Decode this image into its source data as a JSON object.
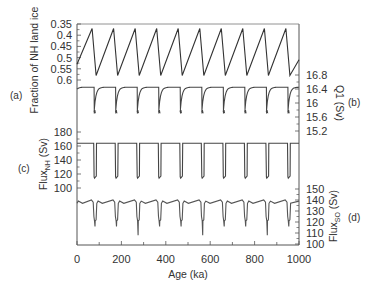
{
  "chart_data": {
    "type": "line",
    "title": "",
    "xlabel": "Age (ka)",
    "xlim": [
      0,
      1000
    ],
    "xticks": [
      0,
      200,
      400,
      600,
      800,
      1000
    ],
    "x_minor_step": 100,
    "grid": false,
    "legend": null,
    "panels": [
      {
        "id": "a",
        "label": "(a)",
        "ylabel": "Fraction of NH land ice",
        "axis_side": "left",
        "inverted": true,
        "ylim": [
          0.35,
          0.6
        ],
        "yticks": [
          "0.35",
          "0.4",
          "0.45",
          "0.5",
          "0.55",
          "0.6"
        ],
        "ytick_values": [
          0.35,
          0.4,
          0.45,
          0.5,
          0.55,
          0.6
        ],
        "description": "Sawtooth cycles, ~97 ka period: slow growth toward ~0.37 then rapid drop to ~0.58",
        "period_ka": 97,
        "x": [
          0,
          68,
          86,
          165,
          183,
          262,
          280,
          359,
          377,
          456,
          474,
          553,
          571,
          650,
          668,
          747,
          765,
          844,
          862,
          941,
          959,
          1000
        ],
        "y": [
          0.53,
          0.37,
          0.58,
          0.37,
          0.58,
          0.37,
          0.58,
          0.37,
          0.58,
          0.37,
          0.58,
          0.37,
          0.58,
          0.37,
          0.58,
          0.37,
          0.58,
          0.37,
          0.58,
          0.37,
          0.58,
          0.51
        ],
        "color": "#333333"
      },
      {
        "id": "b",
        "label": "(b)",
        "ylabel": "Q1 (Sv)",
        "axis_side": "right",
        "inverted": false,
        "ylim": [
          15.0,
          17.0
        ],
        "yticks": [
          "15.2",
          "15.6",
          "16",
          "16.4",
          "16.8"
        ],
        "ytick_values": [
          15.2,
          15.6,
          16.0,
          16.4,
          16.8
        ],
        "description": "Saturating rise to ~16.45 Sv then sharp drop to ~15.75 Sv at each deglaciation",
        "high_value": 16.45,
        "low_value": 15.75,
        "color": "#444444"
      },
      {
        "id": "c",
        "label": "(c)",
        "ylabel": "Flux_NH (Sv)",
        "axis_side": "left",
        "inverted": false,
        "ylim": [
          95,
          185
        ],
        "yticks": [
          "100",
          "120",
          "140",
          "160",
          "180"
        ],
        "ytick_values": [
          100,
          120,
          140,
          160,
          180
        ],
        "description": "Square-wave: ~164 Sv most of cycle, drops to ~114 Sv during deglaciations",
        "high_value": 164,
        "low_value": 114,
        "color": "#444444"
      },
      {
        "id": "d",
        "label": "(d)",
        "ylabel": "Flux_SO (Sv)",
        "axis_side": "right",
        "inverted": false,
        "ylim": [
          100,
          155
        ],
        "yticks": [
          "100",
          "110",
          "120",
          "130",
          "140",
          "150"
        ],
        "ytick_values": [
          100,
          110,
          120,
          130,
          140,
          150
        ],
        "description": "~137-140 Sv plateaus with dips to ~120 Sv and occasional spikes near 110 Sv",
        "high_value": 139,
        "low_value": 121,
        "color": "#555555"
      }
    ],
    "termination_ages_ka": [
      77,
      174,
      271,
      368,
      465,
      562,
      659,
      756,
      853,
      950
    ]
  }
}
